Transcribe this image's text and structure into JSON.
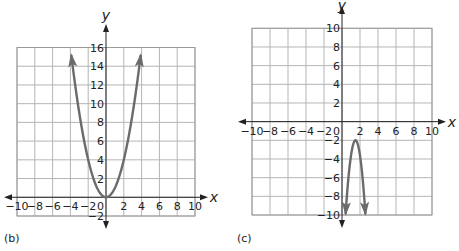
{
  "chart_data": [
    {
      "type": "line",
      "panel_label": "(b)",
      "xlabel": "x",
      "ylabel": "y",
      "xlim": [
        -10,
        10
      ],
      "ylim": [
        -2,
        16
      ],
      "grid": true,
      "x_ticks": [
        -10,
        -8,
        -6,
        -4,
        -2,
        0,
        2,
        4,
        6,
        8,
        10
      ],
      "y_ticks": [
        -2,
        2,
        4,
        6,
        8,
        10,
        12,
        14,
        16
      ],
      "x_tick_labels": [
        "−10",
        "−8",
        "−6",
        "−4",
        "−2",
        "0",
        "2",
        "4",
        "6",
        "8",
        "10"
      ],
      "y_tick_labels": [
        "−2",
        "2",
        "4",
        "6",
        "8",
        "10",
        "12",
        "14",
        "16"
      ],
      "series": [
        {
          "name": "parabola",
          "equation": "y = x^2",
          "vertex": [
            0,
            0
          ],
          "x_range": [
            -3.9,
            3.9
          ],
          "arrows_at_ends": true,
          "points": [
            [
              -3.9,
              15.2
            ],
            [
              -3,
              9
            ],
            [
              -2,
              4
            ],
            [
              -1,
              1
            ],
            [
              0,
              0
            ],
            [
              1,
              1
            ],
            [
              2,
              4
            ],
            [
              3,
              9
            ],
            [
              3.9,
              15.2
            ]
          ]
        }
      ]
    },
    {
      "type": "line",
      "panel_label": "(c)",
      "xlabel": "x",
      "ylabel": "y",
      "xlim": [
        -10,
        10
      ],
      "ylim": [
        -10,
        10
      ],
      "grid": true,
      "x_ticks": [
        -10,
        -8,
        -6,
        -4,
        -2,
        0,
        2,
        4,
        6,
        8,
        10
      ],
      "y_ticks": [
        -10,
        -8,
        -6,
        -4,
        -2,
        2,
        4,
        6,
        8,
        10
      ],
      "x_tick_labels": [
        "−10",
        "−8",
        "−6",
        "−4",
        "−2",
        "0",
        "2",
        "4",
        "6",
        "8",
        "10"
      ],
      "y_tick_labels": [
        "−10",
        "−8",
        "−6",
        "−4",
        "−2",
        "2",
        "4",
        "6",
        "8",
        "10"
      ],
      "series": [
        {
          "name": "parabola",
          "equation": "y = -6.5(x - 1.5)^2 - 2",
          "vertex": [
            1.5,
            -2
          ],
          "x_range": [
            0.4,
            2.6
          ],
          "arrows_at_ends": true,
          "points": [
            [
              0.4,
              -9.9
            ],
            [
              0.8,
              -5.2
            ],
            [
              1.2,
              -2.6
            ],
            [
              1.5,
              -2
            ],
            [
              1.8,
              -2.6
            ],
            [
              2.2,
              -5.2
            ],
            [
              2.6,
              -9.9
            ]
          ]
        }
      ]
    }
  ]
}
